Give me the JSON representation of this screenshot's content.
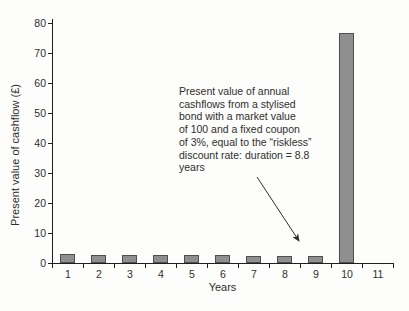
{
  "chart_data": {
    "type": "bar",
    "title": "",
    "xlabel": "Years",
    "ylabel": "Present value of cashflow (£)",
    "categories": [
      "1",
      "2",
      "3",
      "4",
      "5",
      "6",
      "7",
      "8",
      "9",
      "10",
      "11"
    ],
    "values": [
      2.91,
      2.83,
      2.75,
      2.67,
      2.59,
      2.51,
      2.44,
      2.37,
      2.3,
      76.64,
      null
    ],
    "ylim": [
      0,
      80
    ],
    "yticks": [
      0,
      10,
      20,
      30,
      40,
      50,
      60,
      70,
      80
    ],
    "grid": false,
    "legend": "none",
    "bar_fill": "#8f8f8f",
    "bar_border": "#4f4f4f",
    "axis_color": "#1f1f1f",
    "annotation": {
      "text": "Present value of annual\ncashflows from a stylised\nbond with a market value\nof 100 and a fixed coupon\nof 3%, equal to the “riskless”\ndiscount rate: duration = 8.8\nyears",
      "arrow_from": [
        257,
        177
      ],
      "arrow_to": [
        299,
        241
      ]
    }
  }
}
